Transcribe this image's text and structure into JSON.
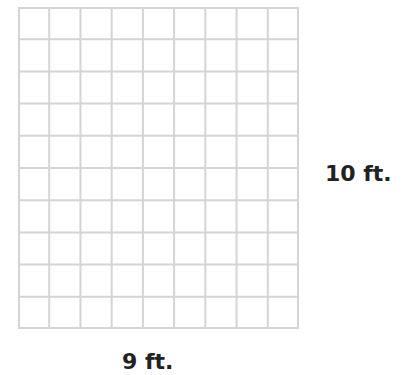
{
  "diagram": {
    "type": "area-grid",
    "columns": 9,
    "rows": 10,
    "grid_color": "#d4d4d4",
    "labels": {
      "height": "10 ft.",
      "width": "9 ft."
    }
  }
}
